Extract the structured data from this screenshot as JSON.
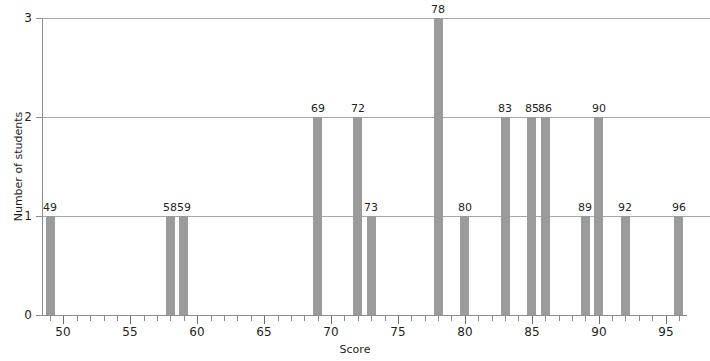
{
  "chart_data": {
    "type": "bar",
    "title": "",
    "xlabel": "Score",
    "ylabel": "Number of students",
    "xlim": [
      48.4,
      96.6
    ],
    "ylim": [
      0,
      3
    ],
    "grid": true,
    "legend": null,
    "x_major_ticks": [
      50,
      55,
      60,
      65,
      70,
      75,
      80,
      85,
      90,
      95
    ],
    "x_minor_tick_step": 1,
    "y_ticks": [
      0,
      1,
      2,
      3
    ],
    "bar_color": "#9b9b9b",
    "gridline_color": "#a7a7a7",
    "axis_color": "#8d8d8d",
    "text_color": "#231f20",
    "categories": [
      49,
      58,
      59,
      69,
      72,
      73,
      78,
      80,
      83,
      85,
      86,
      89,
      90,
      92,
      96
    ],
    "values": [
      1,
      1,
      1,
      2,
      2,
      1,
      3,
      1,
      2,
      2,
      2,
      1,
      2,
      1,
      1
    ],
    "bars": [
      {
        "score": 49,
        "count": 1,
        "label": "49"
      },
      {
        "score": 58,
        "count": 1,
        "label": "58"
      },
      {
        "score": 59,
        "count": 1,
        "label": "59"
      },
      {
        "score": 69,
        "count": 2,
        "label": "69"
      },
      {
        "score": 72,
        "count": 2,
        "label": "72"
      },
      {
        "score": 73,
        "count": 1,
        "label": "73"
      },
      {
        "score": 78,
        "count": 3,
        "label": "78"
      },
      {
        "score": 80,
        "count": 1,
        "label": "80"
      },
      {
        "score": 83,
        "count": 2,
        "label": "83"
      },
      {
        "score": 85,
        "count": 2,
        "label": "85"
      },
      {
        "score": 86,
        "count": 2,
        "label": "86"
      },
      {
        "score": 89,
        "count": 1,
        "label": "89"
      },
      {
        "score": 90,
        "count": 2,
        "label": "90"
      },
      {
        "score": 92,
        "count": 1,
        "label": "92"
      },
      {
        "score": 96,
        "count": 1,
        "label": "96"
      }
    ],
    "y_tick_labels": [
      "0",
      "1",
      "2",
      "3"
    ],
    "x_tick_labels": [
      "50",
      "55",
      "60",
      "65",
      "70",
      "75",
      "80",
      "85",
      "90",
      "95"
    ]
  }
}
